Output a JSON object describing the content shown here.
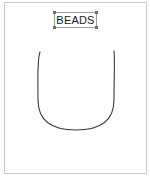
{
  "canvas": {
    "border_color": "#c8c8c8",
    "background": "#ffffff"
  },
  "label": {
    "text": "BEADS",
    "border_color": "#9a9a9a",
    "handle_color": "#6e6e6e",
    "text_color": "#1a1a1a"
  },
  "shape": {
    "type": "u-curve",
    "stroke_color": "#3a3a3a"
  }
}
